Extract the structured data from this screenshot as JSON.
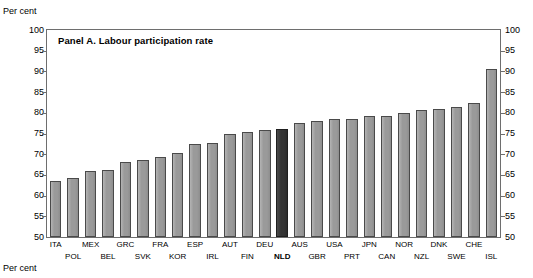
{
  "axis": {
    "unit_label_top": "Per cent",
    "unit_label_bottom": "Per cent"
  },
  "panel": {
    "title": "Panel A. Labour participation rate"
  },
  "chart_data": {
    "type": "bar",
    "title": "Panel A. Labour participation rate",
    "xlabel": "",
    "ylabel": "Per cent",
    "ylim": [
      50,
      100
    ],
    "yticks": [
      50,
      55,
      60,
      65,
      70,
      75,
      80,
      85,
      90,
      95,
      100
    ],
    "ytick_labels": [
      "50",
      "55",
      "60",
      "65",
      "70",
      "75",
      "80",
      "85",
      "90",
      "95",
      "100"
    ],
    "grid": false,
    "legend": null,
    "dual_axis": true,
    "highlight_category": "NLD",
    "colors": {
      "bar": "#9a9a9a",
      "bar_edge": "#4a4a4a",
      "highlight": "#343434",
      "highlight_edge": "#1f1f1f",
      "frame": "#6e6e6e"
    },
    "categories": [
      "ITA",
      "POL",
      "MEX",
      "BEL",
      "GRC",
      "SVK",
      "FRA",
      "KOR",
      "ESP",
      "IRL",
      "AUT",
      "FIN",
      "DEU",
      "NLD",
      "AUS",
      "GBR",
      "USA",
      "PRT",
      "JPN",
      "CAN",
      "NOR",
      "NZL",
      "DNK",
      "SWE",
      "CHE",
      "ISL"
    ],
    "values": [
      63.6,
      64.3,
      65.9,
      66.2,
      68.2,
      68.7,
      69.4,
      70.4,
      72.4,
      72.7,
      74.8,
      75.4,
      75.8,
      76.0,
      77.6,
      78.1,
      78.4,
      78.6,
      79.2,
      79.3,
      79.9,
      80.8,
      80.9,
      81.3,
      82.4,
      90.5
    ],
    "label_rows": [
      0,
      1,
      0,
      1,
      0,
      1,
      0,
      1,
      0,
      1,
      0,
      1,
      0,
      1,
      0,
      1,
      0,
      1,
      0,
      1,
      0,
      1,
      0,
      1,
      0,
      1
    ]
  }
}
